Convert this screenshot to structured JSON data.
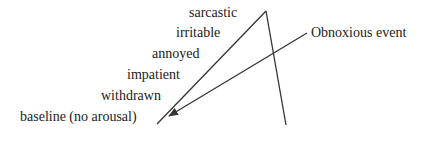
{
  "diagram": {
    "levels": [
      {
        "label": "sarcastic",
        "x": 189,
        "y": 6
      },
      {
        "label": "irritable",
        "x": 176,
        "y": 25
      },
      {
        "label": "annoyed",
        "x": 152,
        "y": 46
      },
      {
        "label": "impatient",
        "x": 127,
        "y": 67
      },
      {
        "label": "withdrawn",
        "x": 101,
        "y": 88
      },
      {
        "label": "baseline (no arousal)",
        "x": 20,
        "y": 110
      }
    ],
    "event_label": "Obnoxious event",
    "colors": {
      "line": "#333333",
      "text": "#222222"
    }
  }
}
